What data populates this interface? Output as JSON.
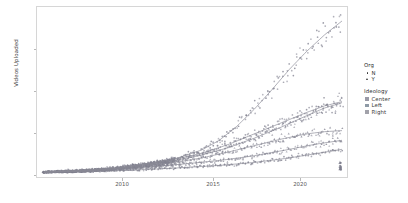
{
  "chart_data": {
    "type": "scatter",
    "title": "",
    "subtitle": "",
    "xlabel": "",
    "ylabel": "Videos Uploaded",
    "xlim": [
      2005.6,
      2023.4
    ],
    "ylim": [
      -300,
      7700
    ],
    "xticks": [
      2010,
      2015,
      2020
    ],
    "xticklabels": [
      "2010",
      "2015",
      "2020"
    ],
    "yticks": [
      0,
      2000,
      4000,
      6000
    ],
    "yticklabels": [
      "0",
      "2000",
      "4000",
      "6000"
    ],
    "grid": false,
    "legend_position": "right",
    "point_color": "#7d7d8c",
    "line_color": "#8a8a95",
    "panel_border_color": "#d6d6d6",
    "legends": [
      {
        "name": "Org",
        "title": "Org",
        "entries": [
          {
            "label": "N",
            "glyph": "circle",
            "color": "#2b2b2b"
          },
          {
            "label": "Y",
            "glyph": "triangle",
            "color": "#2b2b2b"
          }
        ]
      },
      {
        "name": "Ideology",
        "title": "Ideology",
        "entries": [
          {
            "label": "Center",
            "glyph": "square",
            "color": "#9a9aa6"
          },
          {
            "label": "Left",
            "glyph": "square",
            "color": "#8e9aa6"
          },
          {
            "label": "Right",
            "glyph": "square",
            "color": "#a2a2aa"
          }
        ]
      }
    ],
    "series": [
      {
        "name": "trend-steep-top",
        "ideology": "Center",
        "org": "N",
        "x": [
          2006.0,
          2008.0,
          2010.0,
          2012.0,
          2013.5,
          2015.0,
          2016.0,
          2017.0,
          2018.0,
          2019.0,
          2020.0,
          2021.0,
          2022.0,
          2023.0
        ],
        "y": [
          40,
          110,
          230,
          430,
          640,
          1050,
          1500,
          2150,
          2950,
          3850,
          4800,
          5650,
          6400,
          7050
        ]
      },
      {
        "name": "trend-mid-upper",
        "ideology": "Left",
        "org": "N",
        "x": [
          2006.0,
          2008.0,
          2010.0,
          2012.0,
          2013.5,
          2015.0,
          2016.5,
          2018.0,
          2019.5,
          2021.0,
          2022.0,
          2023.0
        ],
        "y": [
          30,
          90,
          200,
          420,
          620,
          900,
          1300,
          1800,
          2300,
          2800,
          3100,
          3300
        ]
      },
      {
        "name": "trend-mid",
        "ideology": "Right",
        "org": "Y",
        "x": [
          2006.0,
          2008.0,
          2010.0,
          2012.0,
          2013.5,
          2015.0,
          2016.5,
          2018.0,
          2019.5,
          2021.0,
          2022.0,
          2023.0
        ],
        "y": [
          25,
          80,
          180,
          380,
          560,
          820,
          1150,
          1600,
          2100,
          2650,
          3000,
          3250
        ]
      },
      {
        "name": "trend-lower-mid",
        "ideology": "Center",
        "org": "Y",
        "x": [
          2006.0,
          2008.0,
          2010.0,
          2012.0,
          2013.5,
          2015.0,
          2016.5,
          2018.0,
          2019.5,
          2021.0,
          2022.0,
          2023.0
        ],
        "y": [
          20,
          70,
          160,
          330,
          480,
          680,
          950,
          1250,
          1550,
          1800,
          1900,
          1950
        ]
      },
      {
        "name": "trend-low",
        "ideology": "Left",
        "org": "Y",
        "x": [
          2006.0,
          2008.0,
          2010.0,
          2012.0,
          2014.0,
          2016.0,
          2018.0,
          2020.0,
          2021.5,
          2023.0
        ],
        "y": [
          15,
          55,
          130,
          260,
          400,
          560,
          780,
          1080,
          1320,
          1500
        ]
      },
      {
        "name": "trend-lowest",
        "ideology": "Right",
        "org": "N",
        "x": [
          2006.0,
          2008.5,
          2011.0,
          2013.5,
          2016.0,
          2018.0,
          2020.0,
          2021.5,
          2023.0
        ],
        "y": [
          10,
          45,
          110,
          210,
          330,
          470,
          680,
          880,
          1080
        ]
      }
    ],
    "notes": {
      "outlier_cluster": "small vertical cluster of low-value points near right edge (~2023, y 150-500)",
      "dense_region": "heavy overplotting of points below 1000 from 2006-2014"
    }
  }
}
